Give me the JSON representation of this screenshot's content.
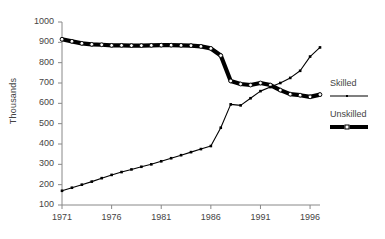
{
  "chart_data": {
    "type": "line",
    "title": "",
    "xlabel": "",
    "ylabel": "Thousands",
    "xlim": [
      1971,
      1997
    ],
    "ylim": [
      100,
      1000
    ],
    "ytick_step": 100,
    "grid": false,
    "legend_position": "right",
    "x": [
      1971,
      1972,
      1973,
      1974,
      1975,
      1976,
      1977,
      1978,
      1979,
      1980,
      1981,
      1982,
      1983,
      1984,
      1985,
      1986,
      1987,
      1988,
      1989,
      1990,
      1991,
      1992,
      1993,
      1994,
      1995,
      1996,
      1997
    ],
    "xtick_labels": [
      "1971",
      "1976",
      "1981",
      "1986",
      "1991",
      "1996"
    ],
    "xtick_values": [
      1971,
      1976,
      1981,
      1986,
      1991,
      1996
    ],
    "ytick_labels": [
      "100",
      "200",
      "300",
      "400",
      "500",
      "600",
      "700",
      "800",
      "900",
      "1000"
    ],
    "ytick_values": [
      100,
      200,
      300,
      400,
      500,
      600,
      700,
      800,
      900,
      1000
    ],
    "series": [
      {
        "name": "Skilled",
        "style": "thin-line",
        "marker": "small-filled-square",
        "values": [
          170,
          185,
          200,
          215,
          232,
          248,
          262,
          275,
          288,
          300,
          315,
          330,
          345,
          360,
          375,
          390,
          400,
          415,
          430,
          450,
          465,
          480,
          500,
          520,
          545,
          570,
          600
        ]
      },
      {
        "name": "Unskilled",
        "style": "thick-line",
        "marker": "open-circle",
        "values": [
          915,
          905,
          895,
          890,
          888,
          885,
          885,
          884,
          884,
          885,
          886,
          886,
          885,
          884,
          880,
          870,
          840,
          800,
          755,
          710,
          690,
          688,
          695,
          690,
          678,
          660,
          645
        ]
      }
    ],
    "legend_entries": [
      {
        "label": "Skilled",
        "key": "thin-line"
      },
      {
        "label": "Unskilled",
        "key": "thick-line"
      }
    ]
  },
  "chart_data_corrected": {
    "skilled": [
      170,
      185,
      200,
      215,
      232,
      248,
      262,
      275,
      288,
      300,
      315,
      330,
      345,
      360,
      375,
      390,
      480,
      595,
      590,
      625,
      660,
      680,
      700,
      725,
      760,
      830,
      875
    ],
    "unskilled": [
      915,
      905,
      895,
      890,
      888,
      885,
      885,
      884,
      884,
      885,
      886,
      886,
      885,
      884,
      880,
      870,
      835,
      710,
      695,
      690,
      700,
      690,
      665,
      645,
      640,
      632,
      643
    ]
  },
  "axis": {
    "ylabel": "Thousands"
  }
}
